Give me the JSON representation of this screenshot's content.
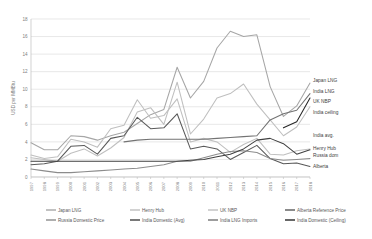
{
  "chart_data": {
    "type": "line",
    "title": "",
    "xlabel": "",
    "ylabel": "USD per MMBtu",
    "ylim": [
      0,
      18
    ],
    "yticks": [
      0,
      2,
      4,
      6,
      8,
      10,
      12,
      14,
      16,
      18
    ],
    "grid": true,
    "legend_position": "bottom",
    "x": [
      1997,
      1998,
      1999,
      2000,
      2001,
      2002,
      2003,
      2004,
      2005,
      2006,
      2007,
      2008,
      2009,
      2010,
      2011,
      2012,
      2013,
      2014,
      2015,
      2016,
      2017,
      2018
    ],
    "xtick_labels": [
      "1997",
      "1998",
      "1999",
      "2000",
      "2001",
      "2002",
      "2003",
      "2004",
      "2005",
      "2006",
      "2007",
      "2008",
      "2009",
      "2010",
      "2011",
      "2012",
      "2013",
      "2014",
      "2015",
      "2016",
      "2017",
      "2018"
    ],
    "series": [
      {
        "name": "Japan LNG",
        "color": "#a6a6a6",
        "values": [
          3.9,
          3.1,
          3.1,
          4.7,
          4.6,
          4.2,
          4.7,
          5.1,
          6.1,
          7.1,
          7.7,
          12.5,
          9.0,
          10.9,
          14.7,
          16.6,
          16.0,
          16.2,
          10.3,
          6.9,
          8.1,
          10.7
        ]
      },
      {
        "name": "Henry Hub",
        "color": "#bfbfbf",
        "values": [
          2.5,
          2.1,
          2.3,
          4.3,
          4.0,
          3.4,
          5.5,
          5.9,
          8.8,
          6.7,
          7.0,
          8.9,
          4.0,
          4.4,
          4.0,
          2.8,
          3.7,
          4.4,
          2.6,
          2.5,
          3.0,
          3.2
        ]
      },
      {
        "name": "UK NBP",
        "color": "#bfbfbf",
        "values": [
          2.2,
          2.0,
          1.8,
          2.7,
          3.2,
          2.4,
          3.3,
          4.5,
          7.4,
          7.9,
          6.0,
          10.8,
          4.9,
          6.6,
          9.0,
          9.5,
          10.6,
          8.3,
          6.5,
          4.7,
          5.7,
          8.0
        ]
      },
      {
        "name": "Alberta Reference Price",
        "color": "#595959",
        "values": [
          1.4,
          1.5,
          1.8,
          3.5,
          3.6,
          2.6,
          4.4,
          4.7,
          6.8,
          5.5,
          5.6,
          7.2,
          3.2,
          3.5,
          3.2,
          2.0,
          2.8,
          3.6,
          2.1,
          1.5,
          1.6,
          1.2
        ]
      },
      {
        "name": "Russia Domestic Price",
        "color": "#8c8c8c",
        "values": [
          0.9,
          0.7,
          0.5,
          0.5,
          0.6,
          0.7,
          0.8,
          0.9,
          1.0,
          1.2,
          1.4,
          1.8,
          1.8,
          2.2,
          2.6,
          2.9,
          3.0,
          2.8,
          2.1,
          1.9,
          2.0,
          2.1
        ]
      },
      {
        "name": "India Domestic (Avg)",
        "color": "#404040",
        "values": [
          1.8,
          1.8,
          1.8,
          1.8,
          1.8,
          1.8,
          1.8,
          1.8,
          1.8,
          1.8,
          1.8,
          1.8,
          1.9,
          2.0,
          2.3,
          2.6,
          3.2,
          4.2,
          4.4,
          3.8,
          2.6,
          3.1
        ]
      },
      {
        "name": "India LNG Imports",
        "color": "#737373",
        "values": [
          null,
          null,
          null,
          null,
          null,
          null,
          null,
          4.0,
          4.2,
          4.3,
          4.3,
          4.3,
          4.3,
          4.3,
          4.4,
          4.5,
          4.6,
          4.7,
          6.5,
          7.2,
          7.6,
          9.5
        ]
      },
      {
        "name": "India Domestic (Ceiling)",
        "color": "#262626",
        "values": [
          null,
          null,
          null,
          null,
          null,
          null,
          null,
          null,
          null,
          null,
          null,
          null,
          null,
          null,
          null,
          null,
          null,
          null,
          null,
          5.6,
          6.3,
          9.0
        ]
      }
    ],
    "annotations": [
      {
        "label": "Japan LNG",
        "x": 313,
        "y": 82
      },
      {
        "label": "India LNG",
        "x": 313,
        "y": 93
      },
      {
        "label": "UK NBP",
        "x": 313,
        "y": 103
      },
      {
        "label": "India ceiling",
        "x": 313,
        "y": 114
      },
      {
        "label": "India avg.",
        "x": 313,
        "y": 137
      },
      {
        "label": "Henry Hub",
        "x": 313,
        "y": 150
      },
      {
        "label": "Russia dom",
        "x": 313,
        "y": 157
      },
      {
        "label": "Alberta",
        "x": 313,
        "y": 168
      }
    ],
    "legend": [
      {
        "label": "Japan LNG",
        "color": "#a6a6a6"
      },
      {
        "label": "Henry Hub",
        "color": "#bfbfbf"
      },
      {
        "label": "UK NBP",
        "color": "#bfbfbf"
      },
      {
        "label": "Alberta Reference Price",
        "color": "#595959"
      },
      {
        "label": "Russia Domestic Price",
        "color": "#8c8c8c"
      },
      {
        "label": "India Domestic (Avg)",
        "color": "#404040"
      },
      {
        "label": "India LNG Imports",
        "color": "#737373"
      },
      {
        "label": "India Domestic (Ceiling)",
        "color": "#262626"
      }
    ]
  }
}
